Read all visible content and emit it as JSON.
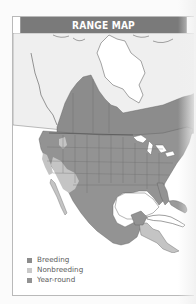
{
  "header": {
    "title": "RANGE MAP"
  },
  "colors": {
    "header_bg": "#7a7a7a",
    "breeding": "#8c8c8c",
    "nonbreeding": "#c4c4c4",
    "year_round": "#939393",
    "land": "#ffffff",
    "nonrange_land": "#eeeeee",
    "borders": "#5c5c5c"
  },
  "map": {
    "region": "North America",
    "ranges": [
      {
        "type": "Breeding",
        "area": "Canadian prairies and boreal band south of Hudson Bay, northern US border states"
      },
      {
        "type": "Year-round",
        "area": "Most of United States, Mexico, and northern Central America"
      },
      {
        "type": "Nonbreeding",
        "area": "Desert Southwest, Baja California, Central Valley, and southern Central America"
      }
    ]
  },
  "legend": {
    "items": [
      {
        "label": "Breeding",
        "color": "#8c8c8c"
      },
      {
        "label": "Nonbreeding",
        "color": "#c9c9c9"
      },
      {
        "label": "Year-round",
        "color": "#939393"
      }
    ]
  }
}
